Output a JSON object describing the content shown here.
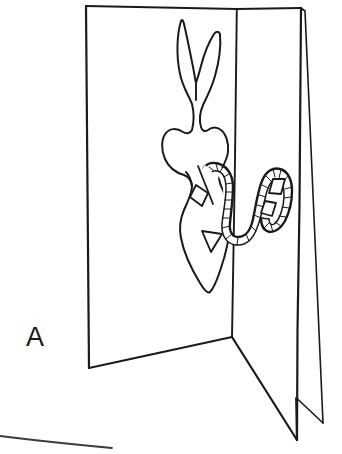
{
  "figure": {
    "label": "A",
    "caption_letter": "A",
    "style": "black-and-white line drawing",
    "background_color": "#ffffff",
    "ink_color": "#1a1a1a",
    "canvas": {
      "width": 342,
      "height": 454
    }
  },
  "parts": {
    "left_panel_name": "left card panel",
    "right_panel_name": "right card panel",
    "spine_name": "center fold spine",
    "rabbit_name": "rabbit pop-up cut-out",
    "ear_left_name": "rabbit left ear",
    "ear_right_name": "rabbit right ear",
    "tail_mark_name": "rabbit tail triangle marking",
    "coil_name": "serpentine paper streamer",
    "diamond_count": 4
  },
  "geometry": {
    "left_panel_outline": "86,6 237,9 232,337 89,368",
    "right_panel_front": "237,9 301,8 297,440 232,337",
    "right_panel_back": "301,8 305,10 323,423 296,398",
    "spine": "237,9 232,337",
    "notch": "296,398 297,440",
    "stray_bottom_line": "0,437 112,447"
  },
  "rabbit": {
    "ear_left_tip": "180,22",
    "ear_right_tip": "221,33",
    "head_top": "196,100",
    "body_center": "200,175",
    "tail_bottom": "208,292",
    "triangle_mark": "203,232 222,234 212,252"
  },
  "coil": {
    "start": "203,175",
    "end": "291,196",
    "wave_count": 3,
    "texture": "hatched ribbed ribbon"
  }
}
